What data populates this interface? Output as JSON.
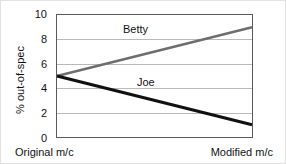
{
  "chart_data": {
    "type": "line",
    "title": "",
    "subtitle": "",
    "xlabel": "",
    "ylabel": "% out-of-spec",
    "categories": [
      "Original m/c",
      "Modified m/c"
    ],
    "x": [
      0,
      1
    ],
    "xlim": [
      0,
      1
    ],
    "ylim": [
      0,
      10
    ],
    "yticks": [
      10,
      8,
      6,
      4,
      2,
      0
    ],
    "ytick_labels": [
      "10",
      "8",
      "6",
      "4",
      "2",
      "0"
    ],
    "grid": "horizontal",
    "legend": "inline-annotations",
    "series": [
      {
        "name": "Betty",
        "values": [
          5,
          9
        ],
        "color": "#6e6e6e",
        "line_width": 2.6,
        "label_text": "Betty"
      },
      {
        "name": "Joe",
        "values": [
          5,
          1
        ],
        "color": "#111111",
        "line_width": 3.0,
        "label_text": "Joe"
      }
    ],
    "annotations": [
      {
        "text": "Betty",
        "series": "Betty"
      },
      {
        "text": "Joe",
        "series": "Joe"
      }
    ]
  },
  "axes": {
    "y_title": "% out-of-spec",
    "y_ticks": [
      {
        "label": "10"
      },
      {
        "label": "8"
      },
      {
        "label": "6"
      },
      {
        "label": "4"
      },
      {
        "label": "2"
      },
      {
        "label": "0"
      }
    ],
    "x_left_label": "Original m/c",
    "x_right_label": "Modified m/c"
  },
  "colors": {
    "betty_line": "#6e6e6e",
    "joe_line": "#111111",
    "gridline": "#b9b9b9",
    "frame": "#5a5a5a",
    "text": "#111111",
    "background": "#ffffff"
  }
}
